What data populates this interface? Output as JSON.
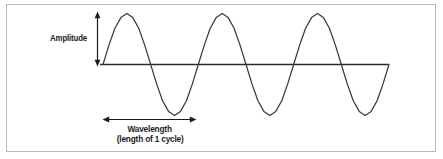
{
  "figure": {
    "type": "wave-diagram",
    "title_text": null,
    "background_color": "#ffffff",
    "frame_border_color": "#b9b9bb",
    "curve_color": "#3a3a3a",
    "baseline_color": "#2b2b2b",
    "text_color": "#1b1b1b"
  },
  "annotations": {
    "amplitude": {
      "label": "Amplitude",
      "arrow": "double-headed-vertical-arrow"
    },
    "wavelength": {
      "label_line1": "Wavelength",
      "label_line2": "(length of 1 cycle)",
      "arrow": "double-headed-horizontal-arrow"
    }
  },
  "chart_data": {
    "type": "line",
    "title": "",
    "xlabel": "Wavelength (length of 1 cycle)",
    "ylabel": "Amplitude",
    "grid": false,
    "legend": "none",
    "axis_style": "baseline-only",
    "xlim": [
      0,
      3
    ],
    "ylim": [
      -1.15,
      1.15
    ],
    "series": [
      {
        "name": "wave",
        "waveform": "sine",
        "cycles": 3,
        "amplitude": 1,
        "wavelength": 1,
        "phase_deg": 0,
        "x": [
          0,
          0.0625,
          0.125,
          0.1875,
          0.25,
          0.3125,
          0.375,
          0.4375,
          0.5,
          0.5625,
          0.625,
          0.6875,
          0.75,
          0.8125,
          0.875,
          0.9375,
          1,
          1.0625,
          1.125,
          1.1875,
          1.25,
          1.3125,
          1.375,
          1.4375,
          1.5,
          1.5625,
          1.625,
          1.6875,
          1.75,
          1.8125,
          1.875,
          1.9375,
          2,
          2.0625,
          2.125,
          2.1875,
          2.25,
          2.3125,
          2.375,
          2.4375,
          2.5,
          2.5625,
          2.625,
          2.6875,
          2.75,
          2.8125,
          2.875,
          2.9375,
          3
        ],
        "values": [
          0,
          0.38,
          0.71,
          0.92,
          1,
          0.92,
          0.71,
          0.38,
          0,
          -0.38,
          -0.71,
          -0.92,
          -1,
          -0.92,
          -0.71,
          -0.38,
          0,
          0.38,
          0.71,
          0.92,
          1,
          0.92,
          0.71,
          0.38,
          0,
          -0.38,
          -0.71,
          -0.92,
          -1,
          -0.92,
          -0.71,
          -0.38,
          0,
          0.38,
          0.71,
          0.92,
          1,
          0.92,
          0.71,
          0.38,
          0,
          -0.38,
          -0.71,
          -0.92,
          -1,
          -0.92,
          -0.71,
          -0.38,
          0
        ]
      }
    ],
    "markers": [
      {
        "name": "amplitude-marker",
        "orientation": "vertical",
        "from": 0,
        "to": 1,
        "label": "Amplitude"
      },
      {
        "name": "wavelength-marker",
        "orientation": "horizontal",
        "from": 0,
        "to": 1,
        "label": "Wavelength"
      }
    ]
  }
}
